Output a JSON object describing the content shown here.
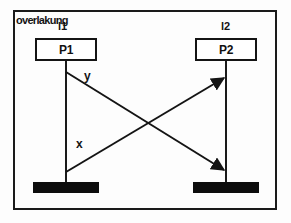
{
  "diagram": {
    "title": "overlakung",
    "frame_color": "#1a1a1a",
    "background_color": "#fdfdfd",
    "ink_color": "#141414"
  },
  "lifelines": [
    {
      "id": "l1",
      "label": "l1",
      "process": "P1"
    },
    {
      "id": "l2",
      "label": "l2",
      "process": "P2"
    }
  ],
  "processes": [
    {
      "id": "p1",
      "label": "P1"
    },
    {
      "id": "p2",
      "label": "P2"
    }
  ],
  "messages": [
    {
      "id": "y",
      "label": "y",
      "direction": "left-to-right",
      "from": "l1",
      "to": "l2",
      "slope": "downward-right"
    },
    {
      "id": "x",
      "label": "x",
      "direction": "left-to-right",
      "from": "l1",
      "to": "l2",
      "slope": "upward-right"
    }
  ],
  "terminators": [
    {
      "id": "term-l1",
      "lifeline": "l1",
      "style": "solid-black-bar"
    },
    {
      "id": "term-l2",
      "lifeline": "l2",
      "style": "solid-black-bar"
    }
  ]
}
